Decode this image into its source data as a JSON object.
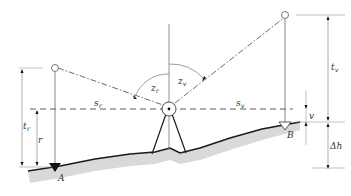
{
  "diagram": {
    "type": "trigonometric-height-measurement",
    "labels": {
      "t_r": {
        "base": "t",
        "sub": "r"
      },
      "r": {
        "base": "r"
      },
      "s_r": {
        "base": "s",
        "sub": "r"
      },
      "z_r": {
        "base": "z",
        "sub": "r"
      },
      "z_v": {
        "base": "z",
        "sub": "v"
      },
      "s_v": {
        "base": "s",
        "sub": "v"
      },
      "t_v": {
        "base": "t",
        "sub": "v"
      },
      "v": {
        "base": "v"
      },
      "delta_h": "Δh",
      "point_a": "A",
      "point_b": "B"
    },
    "colors": {
      "line": "#333333",
      "thin_line": "#777777",
      "ground_fill": "#d9d9d9",
      "ground_line": "#1a1a1a"
    }
  }
}
